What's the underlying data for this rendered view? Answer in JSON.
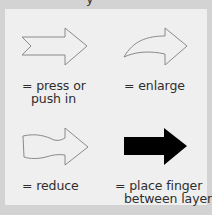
{
  "header": {
    "cut_off_text": "y"
  },
  "legend": {
    "items": [
      {
        "icon": "outline-notched-arrow-icon",
        "line1": "= press or",
        "line2": "push in"
      },
      {
        "icon": "outline-curved-arrow-icon",
        "line1": "= enlarge",
        "line2": ""
      },
      {
        "icon": "outline-wavy-arrow-icon",
        "line1": "= reduce",
        "line2": ""
      },
      {
        "icon": "solid-black-arrow-icon",
        "line1": "= place finger",
        "line2": "between layers"
      }
    ]
  },
  "colors": {
    "frame": "#d3d3d3",
    "panel": "#efefef",
    "arrow_outline": "#8a8a8a",
    "arrow_solid": "#000000",
    "text": "#2e2e2e"
  }
}
